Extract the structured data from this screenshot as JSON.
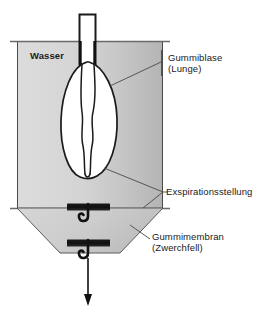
{
  "figure": {
    "type": "labeled-schematic-diagram",
    "width": 263,
    "height": 321
  },
  "labels": {
    "water": "Wasser",
    "balloon_line1": "Gummiblase",
    "balloon_line2": "(Lunge)",
    "expiration": "Exspirationsstellung",
    "membrane_line1": "Gummimembran",
    "membrane_line2": "(Zwerchfell)"
  },
  "colors": {
    "water_fill_light": "#d9d9d9",
    "water_fill_dark": "#b8b8b8",
    "cone_fill": "#cfcfcf",
    "stroke": "#3b3b3b",
    "black": "#111111",
    "balloon_fill": "#ffffff",
    "text": "#1a1a1a",
    "background": "#ffffff"
  },
  "parts": {
    "tube": "glass-tube",
    "tank": "water-tank",
    "balloon": "rubber-balloon-lung",
    "cone": "funnel-cone",
    "membrane_upper": "upper-membrane-bar",
    "membrane_lower": "lower-membrane-bar",
    "hook_upper": "upper-hook",
    "hook_lower": "lower-hook",
    "pull_arrow": "downward-pull-arrow"
  }
}
